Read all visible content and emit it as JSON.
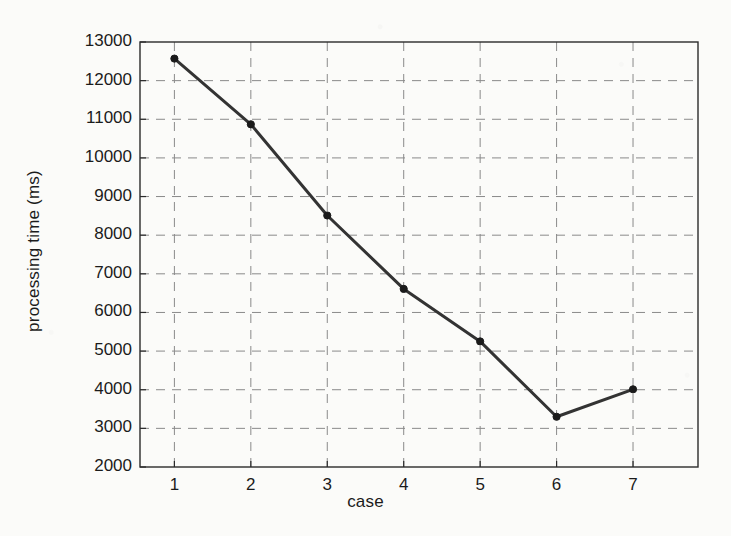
{
  "chart_data": {
    "type": "line",
    "title": "",
    "subtitle": "",
    "xlabel": "case",
    "ylabel": "processing time (ms)",
    "x": [
      1,
      2,
      3,
      4,
      5,
      6,
      7
    ],
    "categories": [
      "1",
      "2",
      "3",
      "4",
      "5",
      "6",
      "7"
    ],
    "values": [
      12570,
      10870,
      8510,
      6610,
      5250,
      3300,
      4010
    ],
    "series": [
      {
        "name": "processing time",
        "values": [
          12570,
          10870,
          8510,
          6610,
          5250,
          3300,
          4010
        ]
      }
    ],
    "xlim": [
      0.55,
      7.85
    ],
    "ylim": [
      2000,
      13000
    ],
    "xticks": [
      1,
      2,
      3,
      4,
      5,
      6,
      7
    ],
    "xtick_labels": [
      "1",
      "2",
      "3",
      "4",
      "5",
      "6",
      "7"
    ],
    "yticks": [
      2000,
      3000,
      4000,
      5000,
      6000,
      7000,
      8000,
      9000,
      10000,
      11000,
      12000,
      13000
    ],
    "ytick_labels": [
      "2000",
      "3000",
      "4000",
      "5000",
      "6000",
      "7000",
      "8000",
      "9000",
      "10000",
      "11000",
      "12000",
      "13000"
    ],
    "grid": true,
    "grid_style": "dashed",
    "legend": null,
    "legend_position": "none",
    "annotations": [],
    "line_color": "#333333",
    "marker": "circle",
    "marker_color": "#1a1a1a",
    "grid_color": "#8a8a8a",
    "axis_color": "#2b2b2b",
    "background_color": "#fbfbf9"
  },
  "figure": {
    "plot_area": {
      "left": 140,
      "top": 42,
      "right": 698,
      "bottom": 467
    }
  }
}
